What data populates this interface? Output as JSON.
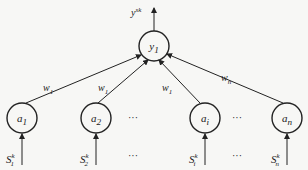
{
  "output": {
    "label": "y",
    "sup": "sk"
  },
  "output_node": {
    "label": "y",
    "sub": "1"
  },
  "weights": [
    {
      "label": "w",
      "sub": "1"
    },
    {
      "label": "w",
      "sub": "1"
    },
    {
      "label": "w",
      "sub": "1"
    },
    {
      "label": "w",
      "sub": "n"
    }
  ],
  "input_nodes": [
    {
      "label": "a",
      "sub": "1"
    },
    {
      "label": "a",
      "sub": "2"
    },
    {
      "label": "a",
      "sub": "i"
    },
    {
      "label": "a",
      "sub": "n"
    }
  ],
  "inputs": [
    {
      "label": "S",
      "sub": "1",
      "sup": "k"
    },
    {
      "label": "S",
      "sub": "2",
      "sup": "k"
    },
    {
      "label": "S",
      "sub": "i",
      "sup": "k"
    },
    {
      "label": "S",
      "sub": "n",
      "sup": "k"
    }
  ],
  "ellipsis": "···"
}
